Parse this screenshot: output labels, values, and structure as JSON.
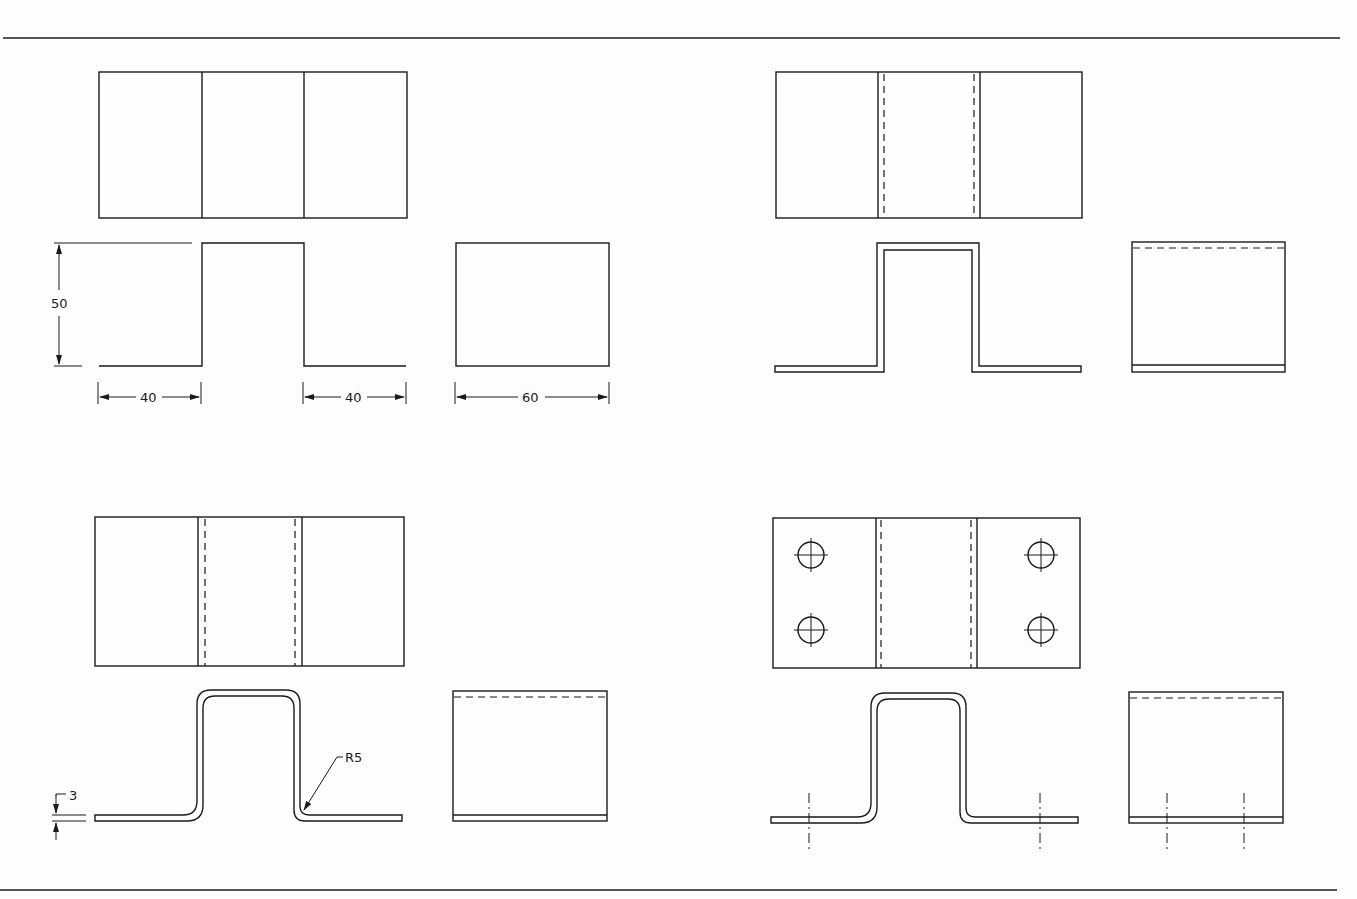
{
  "drawing": {
    "type": "orthographic sheet-metal bracket views",
    "panels": [
      {
        "id": "top-left",
        "description": "Basic shape: top view, front view, side view",
        "dimensions": {
          "height": "50",
          "left_flange": "40",
          "right_flange": "40",
          "depth": "60"
        }
      },
      {
        "id": "top-right",
        "description": "Added material thickness with hidden bend lines"
      },
      {
        "id": "bottom-left",
        "description": "Added bend radii",
        "dimensions": {
          "thickness": "3",
          "radius": "R5"
        }
      },
      {
        "id": "bottom-right",
        "description": "Added four mounting holes with centerlines"
      }
    ],
    "labels": {
      "dim_height": "50",
      "dim_left": "40",
      "dim_right": "40",
      "dim_depth": "60",
      "dim_thickness": "3",
      "dim_radius": "R5"
    },
    "colors": {
      "line": "#1a1a1a",
      "border": "#555555",
      "paper": "#fdfdfd"
    }
  }
}
